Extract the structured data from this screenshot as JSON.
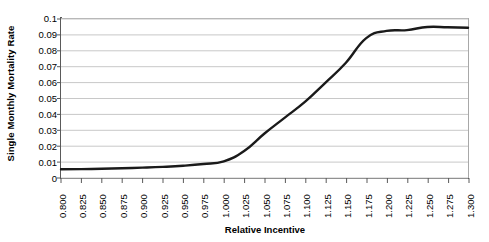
{
  "chart_data": {
    "type": "line",
    "title": "",
    "xlabel": "Relative Incentive",
    "ylabel": "Single Monthly Mortality Rate",
    "xlim": [
      0.8,
      1.3
    ],
    "ylim": [
      0,
      0.1
    ],
    "grid": true,
    "legend": "none",
    "line_color": "#1a1a1a",
    "grid_color": "#c8c8c8",
    "axis_color": "#5a5a5a",
    "x_tick_labels": [
      "0.800",
      "0.825",
      "0.850",
      "0.875",
      "0.900",
      "0.925",
      "0.950",
      "0.975",
      "1.000",
      "1.025",
      "1.050",
      "1.075",
      "1.100",
      "1.125",
      "1.150",
      "1.175",
      "1.200",
      "1.225",
      "1.250",
      "1.275",
      "1.300"
    ],
    "y_tick_labels": [
      "0",
      "0.01",
      "0.02",
      "0.03",
      "0.04",
      "0.05",
      "0.06",
      "0.07",
      "0.08",
      "0.09",
      "0.1"
    ],
    "y_tick_values": [
      0,
      0.01,
      0.02,
      0.03,
      0.04,
      0.05,
      0.06,
      0.07,
      0.08,
      0.09,
      0.1
    ],
    "x": [
      0.8,
      0.825,
      0.85,
      0.875,
      0.9,
      0.925,
      0.95,
      0.975,
      1.0,
      1.025,
      1.05,
      1.075,
      1.1,
      1.125,
      1.15,
      1.175,
      1.2,
      1.225,
      1.25,
      1.275,
      1.3
    ],
    "values": [
      0.0055,
      0.0056,
      0.0058,
      0.0061,
      0.0065,
      0.007,
      0.0077,
      0.0088,
      0.0105,
      0.017,
      0.028,
      0.038,
      0.048,
      0.06,
      0.0725,
      0.088,
      0.0925,
      0.093,
      0.095,
      0.0948,
      0.0945
    ],
    "series": [
      {
        "name": "Single Monthly Mortality Rate",
        "values": [
          0.0055,
          0.0056,
          0.0058,
          0.0061,
          0.0065,
          0.007,
          0.0077,
          0.0088,
          0.0105,
          0.017,
          0.028,
          0.038,
          0.048,
          0.06,
          0.0725,
          0.088,
          0.0925,
          0.093,
          0.095,
          0.0948,
          0.0945
        ]
      }
    ]
  }
}
